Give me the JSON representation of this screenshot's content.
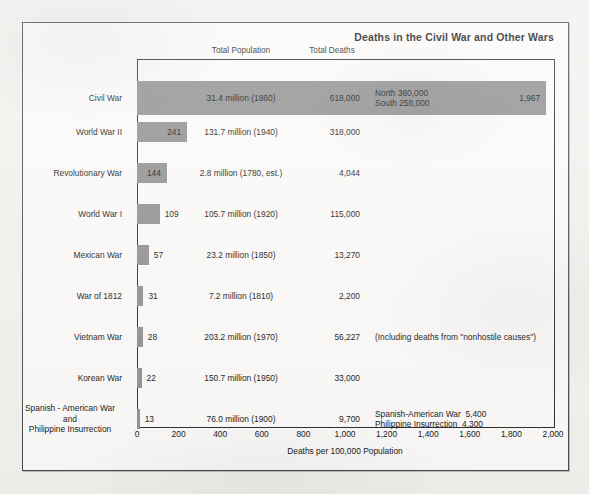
{
  "chart_data": {
    "type": "bar",
    "title": "Deaths in the Civil War and Other Wars",
    "xlabel": "Deaths per 100,000 Population",
    "ylabel": "",
    "xlim": [
      0,
      2000
    ],
    "orientation": "horizontal",
    "grid": false,
    "legend": null,
    "column_headers": [
      "Total Population",
      "Total Deaths"
    ],
    "tick_labels": [
      "0",
      "200",
      "400",
      "600",
      "800",
      "1,000",
      "1,200",
      "1,400",
      "1,600",
      "1,800",
      "2,000"
    ],
    "tick_values": [
      0,
      200,
      400,
      600,
      800,
      1000,
      1200,
      1400,
      1600,
      1800,
      2000
    ],
    "categories": [
      "Civil War",
      "World War II",
      "Revolutionary War",
      "World War I",
      "Mexican War",
      "War of 1812",
      "Vietnam War",
      "Korean War",
      "Spanish - American War and Philippine Insurrection"
    ],
    "values": [
      1967,
      241,
      144,
      109,
      57,
      31,
      28,
      22,
      13
    ],
    "rows": [
      {
        "label": "Civil War",
        "label_lines": [
          "Civil War"
        ],
        "value": 1967,
        "value_label": "1,967",
        "value_inside": true,
        "total_population": "31.4 million (1860)",
        "total_deaths": "618,000",
        "note_lines": [
          "North 360,000",
          "South 258,000"
        ]
      },
      {
        "label": "World War II",
        "label_lines": [
          "World War II"
        ],
        "value": 241,
        "value_label": "241",
        "value_inside": true,
        "total_population": "131.7 million (1940)",
        "total_deaths": "318,000",
        "note_lines": []
      },
      {
        "label": "Revolutionary War",
        "label_lines": [
          "Revolutionary War"
        ],
        "value": 144,
        "value_label": "144",
        "value_inside": true,
        "total_population": "2.8 million (1780, est.)",
        "total_deaths": "4,044",
        "note_lines": []
      },
      {
        "label": "World War I",
        "label_lines": [
          "World War I"
        ],
        "value": 109,
        "value_label": "109",
        "value_inside": true,
        "total_population": "105.7 million (1920)",
        "total_deaths": "115,000",
        "note_lines": []
      },
      {
        "label": "Mexican War",
        "label_lines": [
          "Mexican War"
        ],
        "value": 57,
        "value_label": "57",
        "value_inside": false,
        "total_population": "23.2 million (1850)",
        "total_deaths": "13,270",
        "note_lines": []
      },
      {
        "label": "War of 1812",
        "label_lines": [
          "War of 1812"
        ],
        "value": 31,
        "value_label": "31",
        "value_inside": false,
        "total_population": "7.2 million (1810)",
        "total_deaths": "2,200",
        "note_lines": []
      },
      {
        "label": "Vietnam War",
        "label_lines": [
          "Vietnam War"
        ],
        "value": 28,
        "value_label": "28",
        "value_inside": false,
        "total_population": "203.2 million (1970)",
        "total_deaths": "56,227",
        "note_lines": [
          "(Including deaths from \"nonhostile causes\")"
        ]
      },
      {
        "label": "Korean War",
        "label_lines": [
          "Korean War"
        ],
        "value": 22,
        "value_label": "22",
        "value_inside": false,
        "total_population": "150.7 million (1950)",
        "total_deaths": "33,000",
        "note_lines": []
      },
      {
        "label": "Spanish - American War and Philippine Insurrection",
        "label_lines": [
          "Spanish - American War",
          "and",
          "Philippine Insurrection"
        ],
        "value": 13,
        "value_label": "13",
        "value_inside": false,
        "total_population": "76.0 million (1900)",
        "total_deaths": "9,700",
        "note_lines": [
          "Spanish-American War  5,400",
          "Philippine Insurrection  4,300"
        ]
      }
    ],
    "bar_color": "#8f8f8f",
    "frame_color": "#2b2b2b"
  }
}
